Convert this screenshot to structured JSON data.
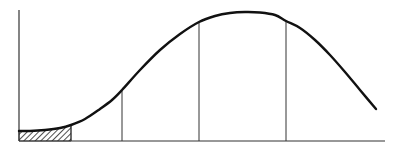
{
  "figure": {
    "colors": {
      "line": "#111111",
      "axis": "#333333",
      "hatch": "#222222",
      "background": "#ffffff"
    },
    "axes": {
      "origin": [
        19,
        141
      ],
      "y_axis_top": 10,
      "x_axis_end": 385
    },
    "curve_points": [
      [
        19,
        131
      ],
      [
        30,
        131
      ],
      [
        45,
        130
      ],
      [
        60,
        128
      ],
      [
        71,
        125
      ],
      [
        85,
        119
      ],
      [
        100,
        109
      ],
      [
        112,
        100
      ],
      [
        122,
        90
      ],
      [
        140,
        70
      ],
      [
        160,
        50
      ],
      [
        180,
        34
      ],
      [
        199,
        22
      ],
      [
        215,
        16
      ],
      [
        230,
        13
      ],
      [
        245,
        12
      ],
      [
        260,
        12.5
      ],
      [
        275,
        15
      ],
      [
        286,
        21
      ],
      [
        300,
        28
      ],
      [
        315,
        40
      ],
      [
        330,
        55
      ],
      [
        345,
        72
      ],
      [
        360,
        90
      ],
      [
        376,
        109
      ]
    ],
    "dividers_x": [
      71,
      122,
      199,
      286
    ],
    "hatched_region": {
      "x_start": 19,
      "x_end": 71
    },
    "labels": []
  }
}
